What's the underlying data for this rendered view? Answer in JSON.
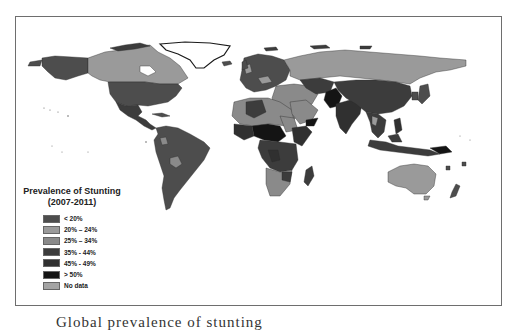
{
  "legend": {
    "title_line1": "Prevalence of Stunting",
    "title_line2": "(2007-2011)",
    "items": [
      {
        "label": "< 20%",
        "color": "#4d4d4d"
      },
      {
        "label": "20% – 24%",
        "color": "#9a9a9a"
      },
      {
        "label": "25% – 34%",
        "color": "#8a8a8a"
      },
      {
        "label": "35% - 44%",
        "color": "#3c3c3c"
      },
      {
        "label": "45% - 49%",
        "color": "#303030"
      },
      {
        "label": "> 50%",
        "color": "#141414"
      },
      {
        "label": "No data",
        "color": "#a4a4a4"
      }
    ]
  },
  "caption": {
    "text": "Global prevalence of stunting"
  },
  "map": {
    "description": "World choropleth map of child stunting prevalence",
    "regions": [
      {
        "name": "Canada",
        "class": "20% – 24%"
      },
      {
        "name": "USA",
        "class": "< 20%"
      },
      {
        "name": "Greenland",
        "class": "No data"
      },
      {
        "name": "Mexico / Central America",
        "class": "35% - 44%"
      },
      {
        "name": "South America",
        "class": "< 20%"
      },
      {
        "name": "Bolivia",
        "class": "25% – 34%"
      },
      {
        "name": "Europe",
        "class": "< 20%"
      },
      {
        "name": "Russia",
        "class": "No data"
      },
      {
        "name": "North Africa",
        "class": "25% – 34%"
      },
      {
        "name": "Sahel / Central Africa",
        "class": "> 50%"
      },
      {
        "name": "Sub-Saharan Africa",
        "class": "35% - 44%"
      },
      {
        "name": "Southern Africa",
        "class": "25% – 34%"
      },
      {
        "name": "Middle East",
        "class": "25% – 34%"
      },
      {
        "name": "South Asia",
        "class": "45% - 49%"
      },
      {
        "name": "Afghanistan",
        "class": "> 50%"
      },
      {
        "name": "China",
        "class": "35% - 44%"
      },
      {
        "name": "Southeast Asia",
        "class": "35% - 44%"
      },
      {
        "name": "Australia",
        "class": "20% – 24%"
      }
    ]
  }
}
